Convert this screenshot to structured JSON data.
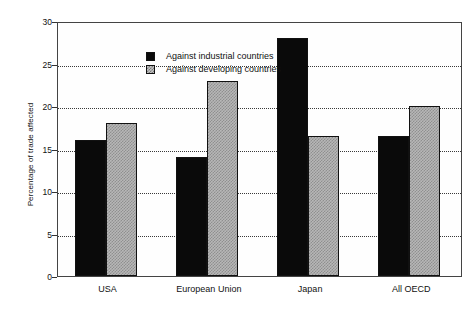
{
  "chart_data": {
    "type": "bar",
    "title": "",
    "xlabel": "",
    "ylabel": "Percentage of trade affected",
    "categories": [
      "USA",
      "European Union",
      "Japan",
      "All OECD"
    ],
    "series": [
      {
        "name": "Against industrial countries",
        "values": [
          16,
          14,
          28,
          16.5
        ],
        "color": "#0a0a0a",
        "pattern": "solid-black"
      },
      {
        "name": "Against developing countries",
        "values": [
          18,
          23,
          16.5,
          20
        ],
        "color": "#b7b7b7",
        "pattern": "checkered-gray"
      }
    ],
    "ylim": [
      0,
      30
    ],
    "yticks": [
      0,
      5,
      10,
      15,
      20,
      25,
      30
    ],
    "ytick_labels": [
      "0",
      "5",
      "10",
      "15",
      "20",
      "25",
      "30"
    ],
    "grid": true,
    "grid_axis": "y",
    "grid_style": "dotted",
    "legend_position": "top-left-inside"
  }
}
